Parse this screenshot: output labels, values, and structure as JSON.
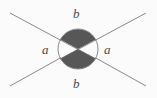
{
  "figure": {
    "kind": "geometry-diagram",
    "width": 157,
    "height": 98,
    "background_color": "#fbfbfb"
  },
  "colors": {
    "line": "#8a8a8a",
    "circle_outline": "#8c8c8c",
    "shaded_sector": "#575757",
    "unshaded_sector": "#fbfbfb",
    "label_text": "#4a4a4a"
  },
  "geometry": {
    "intersection": {
      "x": 78,
      "y": 49
    },
    "circle": {
      "cx": 78,
      "cy": 49,
      "r": 20
    },
    "lines": [
      {
        "name": "line-down-right",
        "x1": 10,
        "y1": 13,
        "x2": 146,
        "y2": 86
      },
      {
        "name": "line-up-right",
        "x1": 10,
        "y1": 86,
        "x2": 146,
        "y2": 13
      }
    ],
    "sectors": [
      {
        "name": "sector-top",
        "label": "b",
        "shaded": true
      },
      {
        "name": "sector-bottom",
        "label": "b",
        "shaded": true
      },
      {
        "name": "sector-left",
        "label": "a",
        "shaded": false
      },
      {
        "name": "sector-right",
        "label": "a",
        "shaded": false
      }
    ]
  },
  "labels": {
    "top": "b",
    "bottom": "b",
    "left": "a",
    "right": "a"
  }
}
